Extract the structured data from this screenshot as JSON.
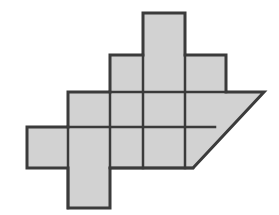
{
  "figure": {
    "title": "Shaded polyomino figure with diagonal cut",
    "background_color": "#ffffff",
    "fill_color": "#d2d2d2",
    "stroke_color": "#3b3b3b",
    "outline_width": 3,
    "grid_line_width": 2.5,
    "cell_width": 41.5,
    "cell_height": 38.8,
    "origin_x": 27,
    "origin_y": 13,
    "columns": 6,
    "rows": 5,
    "shape_type": "polyomino-with-triangle",
    "cells": [
      {
        "name": "cell-r0c3",
        "col": 3,
        "row": 0,
        "label": "top stem square"
      },
      {
        "name": "cell-r1c2",
        "col": 2,
        "row": 1,
        "label": "upper left square"
      },
      {
        "name": "cell-r1c3",
        "col": 3,
        "row": 1,
        "label": "upper middle square"
      },
      {
        "name": "cell-r1c4",
        "col": 4,
        "row": 1,
        "label": "upper right square"
      },
      {
        "name": "cell-r2c1",
        "col": 1,
        "row": 2,
        "label": "middle far-left square"
      },
      {
        "name": "cell-r2c2",
        "col": 2,
        "row": 2,
        "label": "middle left square"
      },
      {
        "name": "cell-r2c3",
        "col": 3,
        "row": 2,
        "label": "middle center square"
      },
      {
        "name": "cell-r2c4",
        "col": 4,
        "row": 2,
        "label": "middle right square"
      },
      {
        "name": "cell-r3c0",
        "col": 0,
        "row": 3,
        "label": "lower far-left square"
      },
      {
        "name": "cell-r3c1",
        "col": 1,
        "row": 3,
        "label": "lower left square"
      },
      {
        "name": "cell-r3c2",
        "col": 2,
        "row": 3,
        "label": "lower center square"
      },
      {
        "name": "cell-r3c3",
        "col": 3,
        "row": 3,
        "label": "lower right square"
      },
      {
        "name": "cell-r4c1",
        "col": 1,
        "row": 4,
        "label": "bottom stem square"
      }
    ],
    "triangle": {
      "name": "right-diagonal-triangle",
      "apex_x": 264,
      "apex_y": 92,
      "base_left_x": 193,
      "base_left_y": 168,
      "top_left_x": 226,
      "top_left_y": 92,
      "label": "right-hand diagonal wedge"
    },
    "outline_path": "M143,13 L185,13 L185,55 L226,55 L226,92 L264,92 L193,168 L110,168 L110,208 L68,208 L68,168 L27,168 L27,127 L68,127 L68,92 L110,92 L110,55 L143,55 Z",
    "interior_segments": [
      {
        "name": "v-line-c3-row1",
        "x1": 143,
        "y1": 55,
        "x2": 143,
        "y2": 168
      },
      {
        "name": "v-line-c4-row1",
        "x1": 185,
        "y1": 55,
        "x2": 185,
        "y2": 168
      },
      {
        "name": "v-line-c2-row2",
        "x1": 110,
        "y1": 92,
        "x2": 110,
        "y2": 168
      },
      {
        "name": "v-line-c1-row3",
        "x1": 68,
        "y1": 127,
        "x2": 68,
        "y2": 208
      },
      {
        "name": "h-line-row1",
        "x1": 110,
        "y1": 92,
        "x2": 226,
        "y2": 92
      },
      {
        "name": "h-line-row2",
        "x1": 68,
        "y1": 127,
        "x2": 215,
        "y2": 127
      },
      {
        "name": "h-line-row3",
        "x1": 110,
        "y1": 168,
        "x2": 193,
        "y2": 168
      }
    ]
  }
}
